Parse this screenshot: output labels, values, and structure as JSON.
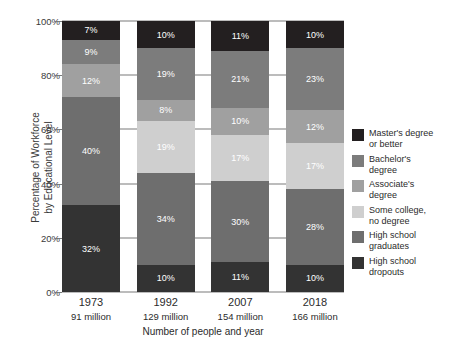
{
  "chart_data": {
    "type": "bar",
    "subtype": "stacked-percentage-column",
    "title": "",
    "xlabel": "Number of people and year",
    "ylabel": "Percentage of Workforce\nby Educational Level",
    "ylim": [
      0,
      100
    ],
    "ytick_labels": [
      "0%",
      "20%",
      "40%",
      "60%",
      "80%",
      "100%"
    ],
    "ytick_values": [
      0,
      20,
      40,
      60,
      80,
      100
    ],
    "grid": true,
    "legend_position": "right",
    "categories": [
      "1973",
      "1992",
      "2007",
      "2018"
    ],
    "category_sublabels": [
      "91 million",
      "129 million",
      "154 million",
      "166 million"
    ],
    "series": [
      {
        "name": "Master's degree or better",
        "color": "#231f20",
        "label_color": "#ffffff",
        "values": [
          7,
          10,
          11,
          10
        ],
        "value_labels": [
          "7%",
          "10%",
          "11%",
          "10%"
        ]
      },
      {
        "name": "Bachelor's degree",
        "color": "#7c7c7c",
        "label_color": "#ffffff",
        "values": [
          9,
          19,
          21,
          23
        ],
        "value_labels": [
          "9%",
          "19%",
          "21%",
          "23%"
        ]
      },
      {
        "name": "Associate's degree",
        "color": "#a0a0a0",
        "label_color": "#ffffff",
        "values": [
          12,
          8,
          10,
          12
        ],
        "value_labels": [
          "12%",
          "8%",
          "10%",
          "12%"
        ]
      },
      {
        "name": "Some college, no degree",
        "color": "#cfcfcf",
        "label_color": "#ffffff",
        "values": [
          0,
          19,
          17,
          17
        ],
        "value_labels": [
          "",
          "19%",
          "17%",
          "17%"
        ]
      },
      {
        "name": "High school graduates",
        "color": "#6e6e6e",
        "label_color": "#ffffff",
        "values": [
          40,
          34,
          30,
          28
        ],
        "value_labels": [
          "40%",
          "34%",
          "30%",
          "28%"
        ]
      },
      {
        "name": "High school dropouts",
        "color": "#333333",
        "label_color": "#ffffff",
        "values": [
          32,
          10,
          11,
          10
        ],
        "value_labels": [
          "32%",
          "10%",
          "11%",
          "10%"
        ]
      }
    ]
  },
  "legend": {
    "items": [
      {
        "label": "Master's degree\nor better",
        "color": "#231f20"
      },
      {
        "label": "Bachelor's\ndegree",
        "color": "#7c7c7c"
      },
      {
        "label": "Associate's\ndegree",
        "color": "#a0a0a0"
      },
      {
        "label": "Some college,\nno degree",
        "color": "#cfcfcf"
      },
      {
        "label": "High school\ngraduates",
        "color": "#6e6e6e"
      },
      {
        "label": "High school\ndropouts",
        "color": "#333333"
      }
    ]
  },
  "axis": {
    "y_title": "Percentage of Workforce\nby Educational Level",
    "x_title": "Number of people and year"
  },
  "colors": {
    "axis_line": "#7a7a7a",
    "text": "#2b2b2b",
    "background": "#ffffff"
  }
}
